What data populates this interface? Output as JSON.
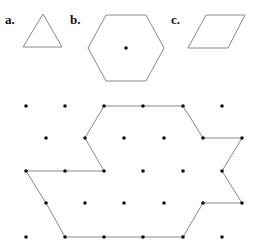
{
  "labels": {
    "a": "a.",
    "b": "b.",
    "c": "c."
  },
  "shapes": {
    "triangle": {
      "points": [
        [
          43,
          14
        ],
        [
          23,
          47
        ],
        [
          62,
          47
        ]
      ]
    },
    "hexagon": {
      "points": [
        [
          106,
          15
        ],
        [
          146,
          15
        ],
        [
          164,
          48
        ],
        [
          146,
          81
        ],
        [
          106,
          81
        ],
        [
          88,
          48
        ]
      ],
      "center": [
        126,
        48
      ]
    },
    "rhombus": {
      "points": [
        [
          206,
          15
        ],
        [
          245,
          15
        ],
        [
          228,
          48
        ],
        [
          188,
          48
        ]
      ]
    }
  },
  "grid": {
    "rows": [
      {
        "y": 106,
        "x": [
          26,
          65,
          104,
          143,
          183,
          222
        ]
      },
      {
        "y": 138,
        "x": [
          46,
          85,
          124,
          164,
          203,
          242
        ]
      },
      {
        "y": 171,
        "x": [
          26,
          65,
          104,
          143,
          183,
          222
        ]
      },
      {
        "y": 203,
        "x": [
          46,
          85,
          124,
          164,
          203,
          242
        ]
      },
      {
        "y": 237,
        "x": [
          26,
          65,
          104,
          143,
          183,
          222
        ]
      }
    ]
  },
  "outline": {
    "points": [
      [
        104,
        106
      ],
      [
        143,
        106
      ],
      [
        183,
        106
      ],
      [
        203,
        138
      ],
      [
        242,
        138
      ],
      [
        222,
        171
      ],
      [
        242,
        203
      ],
      [
        203,
        203
      ],
      [
        183,
        237
      ],
      [
        143,
        237
      ],
      [
        104,
        237
      ],
      [
        65,
        237
      ],
      [
        46,
        203
      ],
      [
        26,
        171
      ],
      [
        65,
        171
      ],
      [
        104,
        171
      ],
      [
        85,
        138
      ]
    ]
  },
  "colors": {
    "line": "#888888",
    "dot": "#111111"
  }
}
